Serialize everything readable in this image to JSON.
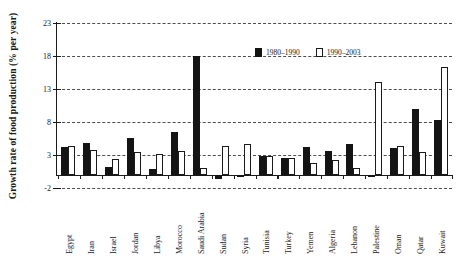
{
  "chart_data": {
    "type": "bar",
    "title": "",
    "xlabel": "",
    "ylabel": "Growth rate of food production (% per year)",
    "ylim": [
      -2,
      23
    ],
    "yticks": [
      -2,
      3,
      8,
      13,
      18,
      23
    ],
    "ytick_labels": [
      "-2",
      "3",
      "8",
      "13",
      "18",
      "23"
    ],
    "grid": true,
    "legend_position": "top-right",
    "categories": [
      "Egypt",
      "Iran",
      "Israel",
      "Jordan",
      "Libya",
      "Morocco",
      "Saudi Arabia",
      "Sudan",
      "Syria",
      "Tunisia",
      "Turkey",
      "Yemen",
      "Algeria",
      "Lebanon",
      "Palestine",
      "Oman",
      "Qatar",
      "Kuwait"
    ],
    "series": [
      {
        "name": "1980–1990",
        "color": "#141414",
        "values": [
          4.2,
          4.8,
          1.2,
          5.6,
          0.9,
          6.5,
          18.0,
          -0.6,
          -0.3,
          2.9,
          2.6,
          4.2,
          3.6,
          4.6,
          -0.2,
          4.1,
          9.9,
          8.3
        ]
      },
      {
        "name": "1990–2003",
        "color": "#ffffff",
        "values": [
          4.3,
          3.7,
          2.4,
          3.4,
          3.2,
          3.6,
          1.0,
          4.4,
          4.7,
          2.9,
          2.6,
          1.8,
          2.2,
          1.0,
          14.0,
          4.4,
          3.5,
          16.3
        ]
      }
    ]
  },
  "legend": {
    "items": [
      {
        "label": "1980–1990",
        "style": "filled"
      },
      {
        "label": "1990–2003",
        "style": "outline"
      }
    ]
  }
}
